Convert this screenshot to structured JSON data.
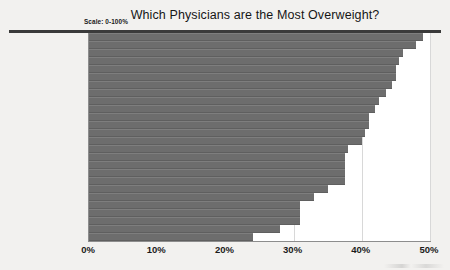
{
  "chart_data": {
    "type": "bar",
    "orientation": "horizontal",
    "title": "Which Physicians are the Most Overweight?",
    "annotation": "Scale: 0-100%",
    "xlabel": "",
    "ylabel": "",
    "xlim": [
      0,
      50
    ],
    "xticks": [
      "0%",
      "10%",
      "20%",
      "30%",
      "40%",
      "50%"
    ],
    "xtick_values": [
      0,
      10,
      20,
      30,
      40,
      50
    ],
    "grid": true,
    "legend": "none",
    "bar_color": "#6d6d6d",
    "background_color": "#f2f1ef",
    "plot_background_color": "#ffffff",
    "categories": [
      "General Surgery",
      "Family Medicine",
      "Gastroenterology",
      "Critical Care",
      "Pulmonary Medicine",
      "Ob/Gyn & Women's Health",
      "Orthopedics",
      "Anesthesiology",
      "Cardiology",
      "Internal Medicine",
      "Emergency Medicine",
      "Urology",
      "Psychiatry & Mental Health",
      "Neurology",
      "HIV/Infectious Diseases",
      "Pathology",
      "Oncology",
      "Radiology",
      "Pediatrics",
      "Nephrology",
      "Rheumatology",
      "Diabetes & Endocrinology",
      "Allergy & Clinical Immunology",
      "Plastic Surgery",
      "Ophthalmology",
      "Dermatology"
    ],
    "values": [
      49,
      48,
      46,
      45.5,
      45,
      45,
      44.5,
      43.5,
      42.5,
      42,
      41,
      41,
      40.5,
      40,
      38,
      37.5,
      37.5,
      37.5,
      37.5,
      35,
      33,
      31,
      31,
      31,
      28,
      24
    ]
  }
}
